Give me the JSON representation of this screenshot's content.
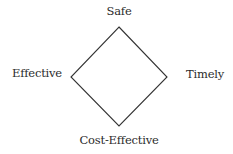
{
  "diagram": {
    "type": "diamond",
    "line_color": "#333333",
    "text_color": "#2b2b2b",
    "background": "#ffffff",
    "vertices": {
      "top": [
        119,
        27
      ],
      "right": [
        167,
        77
      ],
      "bottom": [
        119,
        126
      ],
      "left": [
        71,
        77
      ]
    },
    "labels": {
      "top": "Safe",
      "left": "Effective",
      "right": "Timely",
      "bottom": "Cost-Effective"
    }
  }
}
